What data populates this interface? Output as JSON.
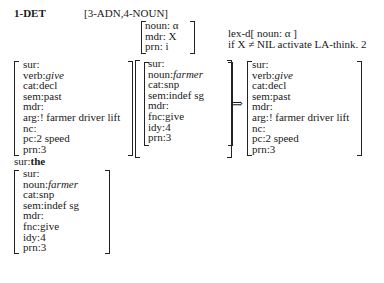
{
  "header": {
    "label": "1-DET",
    "pattern": "[3-ADN,4-NOUN]"
  },
  "rule_pattern": {
    "lines": [
      "noun: α",
      "mdr: X",
      "prn: i"
    ]
  },
  "operations": {
    "line1": "lex-d[ noun: α ]",
    "line2": "if X ≠ NIL activate LA-think. 2"
  },
  "input_verb": {
    "lines": [
      {
        "attr": "sur:",
        "val": ""
      },
      {
        "attr": "verb:",
        "val": "give",
        "italic": true
      },
      {
        "attr": "cat:",
        "val": "decl"
      },
      {
        "attr": "sem:",
        "val": "past"
      },
      {
        "attr": "mdr:",
        "val": ""
      },
      {
        "attr": "arg:",
        "val": "! farmer driver lift"
      },
      {
        "attr": "nc:",
        "val": ""
      },
      {
        "attr": "pc:",
        "val": "2  speed"
      },
      {
        "attr": "prn:",
        "val": "3"
      }
    ]
  },
  "input_noun": {
    "lines": [
      {
        "attr": "sur:",
        "val": ""
      },
      {
        "attr": "noun:",
        "val": "farmer",
        "italic": true
      },
      {
        "attr": "cat:",
        "val": "snp"
      },
      {
        "attr": "sem:",
        "val": "indef sg"
      },
      {
        "attr": "mdr:",
        "val": ""
      },
      {
        "attr": "fnc:",
        "val": "give"
      },
      {
        "attr": "idy:",
        "val": "4"
      },
      {
        "attr": "prn:",
        "val": "3"
      }
    ]
  },
  "arrow": "⇒",
  "output_verb": {
    "lines": [
      {
        "attr": "sur:",
        "val": ""
      },
      {
        "attr": "verb:",
        "val": "give",
        "italic": true
      },
      {
        "attr": "cat:",
        "val": "decl"
      },
      {
        "attr": "sem:",
        "val": "past"
      },
      {
        "attr": "mdr:",
        "val": ""
      },
      {
        "attr": "arg:",
        "val": "! farmer driver lift"
      },
      {
        "attr": "nc:",
        "val": ""
      },
      {
        "attr": "pc:",
        "val": "2  speed"
      },
      {
        "attr": "prn:",
        "val": "3"
      }
    ]
  },
  "surface": {
    "label_attr": "sur:",
    "label_val": "the"
  },
  "output_noun": {
    "lines": [
      {
        "attr": "sur:",
        "val": ""
      },
      {
        "attr": "noun:",
        "val": "farmer",
        "italic": true
      },
      {
        "attr": "cat:",
        "val": "snp"
      },
      {
        "attr": "sem:",
        "val": "indef sg"
      },
      {
        "attr": "mdr:",
        "val": ""
      },
      {
        "attr": "fnc:",
        "val": "give"
      },
      {
        "attr": "idy:",
        "val": "4"
      },
      {
        "attr": "prn:",
        "val": "3"
      }
    ]
  }
}
